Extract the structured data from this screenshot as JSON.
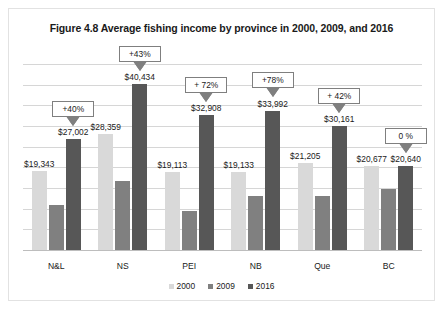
{
  "chart_data": {
    "type": "bar",
    "title": "Figure 4.8 Average fishing income by province in 2000, 2009, and 2016",
    "xlabel": "",
    "ylabel": "",
    "ylim": [
      0,
      45000
    ],
    "grid": true,
    "gridline_values": [
      5000,
      10000,
      15000,
      20000,
      25000,
      30000,
      35000,
      40000,
      45000
    ],
    "legend_position": "bottom",
    "categories": [
      "N&L",
      "NS",
      "PEI",
      "NB",
      "Que",
      "BC"
    ],
    "series": [
      {
        "name": "2000",
        "color": "#d9d9d9",
        "values": [
          19343,
          28359,
          19113,
          19133,
          21205,
          20677
        ],
        "labels": [
          "$19,343",
          "$28,359",
          "$19,113",
          "$19,133",
          "$21,205",
          "$20,677"
        ]
      },
      {
        "name": "2009",
        "color": "#808080",
        "values": [
          11100,
          17000,
          9600,
          13300,
          13400,
          15100
        ],
        "labels": [
          "",
          "",
          "",
          "",
          "",
          ""
        ]
      },
      {
        "name": "2016",
        "color": "#575757",
        "values": [
          27002,
          40434,
          32908,
          33992,
          30161,
          20640
        ],
        "labels": [
          "$27,002",
          "$40,434",
          "$32,908",
          "$33,992",
          "$30,161",
          "$20,640"
        ]
      }
    ],
    "annotations": [
      {
        "category": "N&L",
        "text": "+40%"
      },
      {
        "category": "NS",
        "text": "+43%"
      },
      {
        "category": "PEI",
        "text": "+ 72%"
      },
      {
        "category": "NB",
        "text": "+78%"
      },
      {
        "category": "Que",
        "text": "+ 42%"
      },
      {
        "category": "BC",
        "text": "0 %"
      }
    ]
  },
  "legend": {
    "items": [
      {
        "label": "2000",
        "color": "#d9d9d9"
      },
      {
        "label": "2009",
        "color": "#808080"
      },
      {
        "label": "2016",
        "color": "#575757"
      }
    ]
  }
}
